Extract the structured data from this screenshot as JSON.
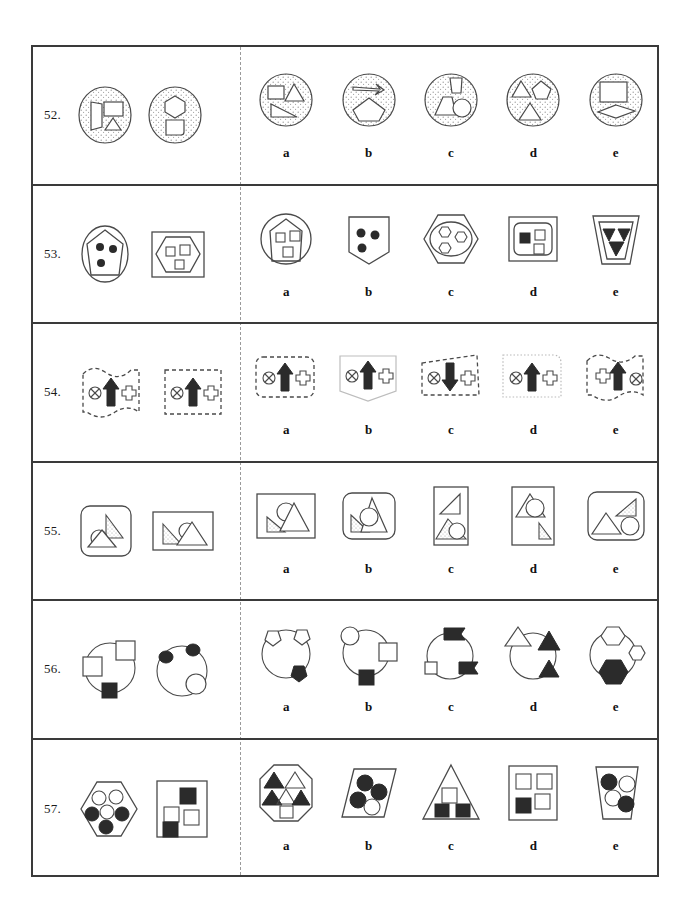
{
  "page": {
    "type": "non-verbal-reasoning-worksheet",
    "border_color": "#3a3a3a",
    "ink_color": "#4a4a4a",
    "fill_color": "#2b2b2b",
    "divider_style": "vertical dotted line"
  },
  "option_labels": [
    "a",
    "b",
    "c",
    "d",
    "e"
  ],
  "rows": [
    {
      "number": "52.",
      "stimulus_count": 2,
      "stimulus_desc": [
        "stippled circle containing quadrilateral, rectangle and small triangle",
        "stippled circle containing hexagon above rounded square"
      ],
      "options": [
        {
          "label": "a",
          "desc": "stippled circle with square, triangle and right triangle"
        },
        {
          "label": "b",
          "desc": "stippled circle with flat arrow and pentagon"
        },
        {
          "label": "c",
          "desc": "stippled circle with small trapezoid, trapezoid and circle"
        },
        {
          "label": "d",
          "desc": "stippled circle with triangle, pentagon and triangle"
        },
        {
          "label": "e",
          "desc": "stippled circle with rectangle and rhombus"
        }
      ]
    },
    {
      "number": "53.",
      "stimulus_count": 2,
      "stimulus_desc": [
        "ellipse outline around pentagon containing three filled dots",
        "square outline around hexagon containing three small open squares"
      ],
      "options": [
        {
          "label": "a",
          "desc": "circle around pentagon with three open squares"
        },
        {
          "label": "b",
          "desc": "pentagon shield with three filled dots"
        },
        {
          "label": "c",
          "desc": "hexagon around ellipse with three open hexagons"
        },
        {
          "label": "d",
          "desc": "square around rounded square with one filled and two open squares"
        },
        {
          "label": "e",
          "desc": "trapezoid around inverted trapezoid with three filled triangles"
        }
      ]
    },
    {
      "number": "54.",
      "stimulus_count": 2,
      "stimulus_desc": [
        "wavy dashed outline containing crossed circle, up arrow, cross",
        "rectangular dashed outline containing crossed circle, up arrow, cross"
      ],
      "options": [
        {
          "label": "a",
          "desc": "rounded dashed rectangle: crossed circle, up arrow, cross"
        },
        {
          "label": "b",
          "desc": "light solid shield: crossed circle, up arrow, cross"
        },
        {
          "label": "c",
          "desc": "dashed quadrilateral: crossed circle, DOWN arrow, cross"
        },
        {
          "label": "d",
          "desc": "light dotted rounded panel: crossed circle, up arrow, cross"
        },
        {
          "label": "e",
          "desc": "wavy dashed outline: cross, up arrow, crossed circle"
        }
      ]
    },
    {
      "number": "55.",
      "stimulus_count": 2,
      "stimulus_desc": [
        "rounded rectangle with stippled right triangle, circle and triangle",
        "rectangle with stippled right triangle, circle and triangle"
      ],
      "options": [
        {
          "label": "a",
          "desc": "square with small stippled triangle, circle and large triangle"
        },
        {
          "label": "b",
          "desc": "rounded square with stippled triangle, circle and tall triangle"
        },
        {
          "label": "c",
          "desc": "tall rectangle with plain triangle above stippled triangle and circle"
        },
        {
          "label": "d",
          "desc": "tall rectangle with triangle and circle above small stippled triangle"
        },
        {
          "label": "e",
          "desc": "rounded rectangle with stippled triangle, plain triangle and circle"
        }
      ]
    },
    {
      "number": "56.",
      "stimulus_count": 2,
      "stimulus_desc": [
        "circle with open square at left, open square upper right, filled square lower left",
        "circle with filled ellipse upper left, filled ellipse top, open circle lower right"
      ],
      "options": [
        {
          "label": "a",
          "desc": "circle with two open pentagons on rim and a filled pentagon below"
        },
        {
          "label": "b",
          "desc": "circle with open circle, open square and filled square"
        },
        {
          "label": "c",
          "desc": "circle with filled flag top, small open square and filled flag"
        },
        {
          "label": "d",
          "desc": "circle with open triangle and two filled triangles"
        },
        {
          "label": "e",
          "desc": "circle with two open hexagons and one filled hexagon"
        }
      ]
    },
    {
      "number": "57.",
      "stimulus_count": 2,
      "stimulus_desc": [
        "hexagon with three open circles and three filled circles",
        "square with two filled squares and two open squares"
      ],
      "options": [
        {
          "label": "a",
          "desc": "octagon with three filled and two open triangles plus open square"
        },
        {
          "label": "b",
          "desc": "parallelogram with three filled circles and one open circle"
        },
        {
          "label": "c",
          "desc": "triangle with one open square and two filled squares"
        },
        {
          "label": "d",
          "desc": "rectangle with three open squares and one filled square"
        },
        {
          "label": "e",
          "desc": "trapezoid with two filled circles and two open circles"
        }
      ]
    }
  ]
}
